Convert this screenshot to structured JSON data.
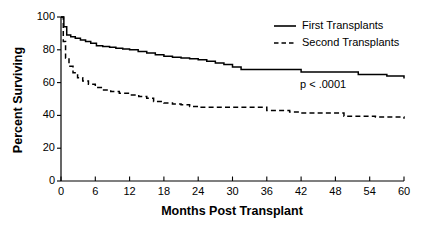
{
  "chart_data": {
    "type": "line",
    "subtype": "kaplan-meier-step",
    "title": "",
    "xlabel": "Months Post Transplant",
    "ylabel": "Percent Surviving",
    "xlim": [
      0,
      60
    ],
    "ylim": [
      0,
      100
    ],
    "xticks": [
      0,
      6,
      12,
      18,
      24,
      30,
      36,
      42,
      48,
      54,
      60
    ],
    "xtick_labels": [
      "0",
      "6",
      "12",
      "18",
      "24",
      "30",
      "36",
      "42",
      "48",
      "54",
      "60"
    ],
    "yticks": [
      0,
      20,
      40,
      60,
      80,
      100
    ],
    "ytick_labels": [
      "0",
      "20",
      "40",
      "60",
      "80",
      "100"
    ],
    "grid": false,
    "legend_position": "top-right",
    "annotations": [
      {
        "text": "p < .0001",
        "x": 42,
        "y": 57
      }
    ],
    "series": [
      {
        "name": "First Transplants",
        "style": "solid",
        "color": "#000000",
        "x": [
          0,
          0.5,
          1,
          1.7,
          2.5,
          3.4,
          4.3,
          5.2,
          6.2,
          7.3,
          8.5,
          9.6,
          10.8,
          12,
          13.5,
          15,
          16.5,
          18,
          19.5,
          21,
          22.5,
          24,
          25.5,
          27,
          28.5,
          30,
          31.5,
          36,
          40.5,
          42,
          48,
          52,
          57,
          60
        ],
        "y": [
          100,
          94,
          89,
          88,
          87,
          86,
          85,
          84,
          82.5,
          82,
          81.5,
          81,
          80.5,
          80,
          79,
          78,
          77,
          76,
          75.5,
          75,
          74.5,
          74,
          73,
          72,
          71,
          69.5,
          68,
          68,
          68,
          66.5,
          66.5,
          65,
          64,
          62.5
        ],
        "endpoint_value": 62.5
      },
      {
        "name": "Second Transplants",
        "style": "dashed",
        "color": "#000000",
        "x": [
          0,
          0.4,
          0.8,
          1.4,
          2.1,
          2.9,
          3.8,
          4.8,
          6,
          7.3,
          8.7,
          10.2,
          12,
          13.6,
          15,
          16.2,
          18,
          19.5,
          21,
          22.5,
          24,
          30,
          33.5,
          36,
          40,
          42,
          48,
          49.5,
          55,
          60
        ],
        "y": [
          100,
          85,
          75,
          70,
          66,
          63,
          61,
          59,
          57,
          55.5,
          54.5,
          53.5,
          52.5,
          51.5,
          50.5,
          48.5,
          47.5,
          47,
          46.5,
          45.5,
          45,
          45,
          45,
          43,
          42,
          41.5,
          41.5,
          39.5,
          39,
          38
        ],
        "endpoint_value": 38
      }
    ]
  },
  "legend": {
    "items": [
      {
        "label": "First Transplants",
        "style": "solid"
      },
      {
        "label": "Second Transplants",
        "style": "dashed"
      }
    ]
  },
  "annotation": {
    "pvalue_text": "p < .0001"
  },
  "axes": {
    "x_title": "Months Post Transplant",
    "y_title": "Percent Surviving"
  }
}
